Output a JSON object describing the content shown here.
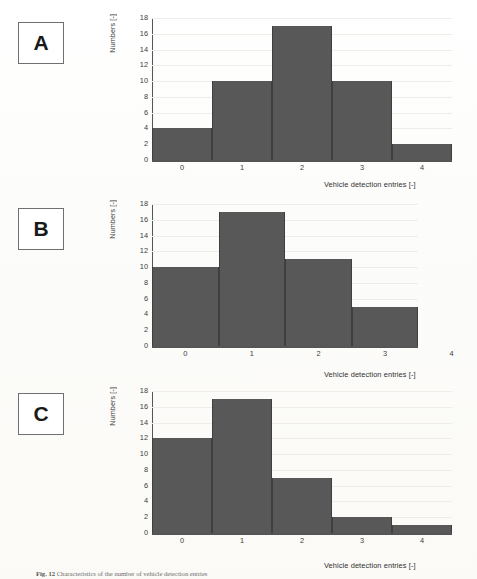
{
  "figure": {
    "caption_label": "Fig. 12",
    "caption_text": "Characteristics of the number of vehicle detection entries"
  },
  "axis": {
    "ylabel": "Numbers [-]",
    "xlabel": "Vehicle detection entries [-]",
    "yticks": [
      "18",
      "16",
      "14",
      "12",
      "10",
      "8",
      "6",
      "4",
      "2",
      "0"
    ],
    "xticks": [
      "0",
      "1",
      "2",
      "3",
      "4"
    ]
  },
  "style": {
    "bar_color": "#585858",
    "bar_edge_color": "#3f3f3f",
    "axis_color": "#555555",
    "grid_color": "#f0ecea",
    "page_background": "#fdfdfb"
  },
  "panels": [
    {
      "tag": "A",
      "name": "panel-a"
    },
    {
      "tag": "B",
      "name": "panel-b"
    },
    {
      "tag": "C",
      "name": "panel-c"
    }
  ],
  "chart_data": [
    {
      "type": "bar",
      "panel": "A",
      "title": "",
      "categories": [
        "0",
        "1",
        "2",
        "3",
        "4"
      ],
      "values": [
        4,
        10,
        17,
        10,
        2
      ],
      "xlabel": "Vehicle detection entries [-]",
      "ylabel": "Numbers [-]",
      "ylim": [
        0,
        18
      ],
      "ytick_step": 2,
      "grid": true,
      "legend": "none"
    },
    {
      "type": "bar",
      "panel": "B",
      "title": "",
      "categories": [
        "0",
        "1",
        "2",
        "3",
        "4"
      ],
      "values": [
        10,
        17,
        11,
        5,
        0
      ],
      "xlabel": "Vehicle detection entries [-]",
      "ylabel": "Numbers [-]",
      "ylim": [
        0,
        18
      ],
      "ytick_step": 2,
      "grid": true,
      "legend": "none"
    },
    {
      "type": "bar",
      "panel": "C",
      "title": "",
      "categories": [
        "0",
        "1",
        "2",
        "3",
        "4"
      ],
      "values": [
        12,
        17,
        7,
        2,
        1
      ],
      "xlabel": "Vehicle detection entries [-]",
      "ylabel": "Numbers [-]",
      "ylim": [
        0,
        18
      ],
      "ytick_step": 2,
      "grid": true,
      "legend": "none"
    }
  ]
}
